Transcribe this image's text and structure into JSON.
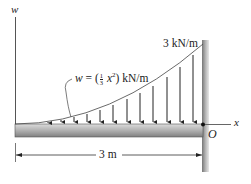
{
  "figure": {
    "axis_w_label": "w",
    "axis_x_label": "x",
    "origin_label": "O",
    "max_load_label": "3 kN/m",
    "load_equation": {
      "prefix": "w = (",
      "fraction_num": "1",
      "fraction_den": "3",
      "term": "x",
      "exponent": "2",
      "suffix": ") kN/m"
    },
    "span_label": "3 m"
  },
  "colors": {
    "line": "#333333",
    "beam_top": "#d0d0d0",
    "beam_bottom": "#8a8a8a",
    "wall": "#9a9a9a"
  }
}
